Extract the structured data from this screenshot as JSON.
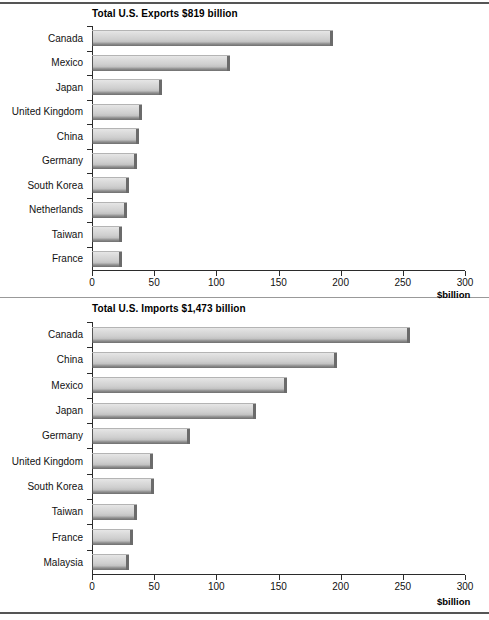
{
  "chart_data": [
    {
      "type": "bar",
      "orientation": "horizontal",
      "title": "Total U.S. Exports $819 billion",
      "xlabel": "$billion",
      "ylabel": "",
      "xlim": [
        0,
        300
      ],
      "xticks": [
        0,
        50,
        100,
        150,
        200,
        250,
        300
      ],
      "xtick_labels": [
        "0",
        "50",
        "100",
        "150",
        "200",
        "250",
        "300"
      ],
      "grid": false,
      "legend": null,
      "categories": [
        "Canada",
        "Mexico",
        "Japan",
        "United Kingdom",
        "China",
        "Germany",
        "South Korea",
        "Netherlands",
        "Taiwan",
        "France"
      ],
      "values": [
        194,
        111,
        56,
        40,
        38,
        36,
        30,
        28,
        24,
        24
      ]
    },
    {
      "type": "bar",
      "orientation": "horizontal",
      "title": "Total U.S. Imports $1,473 billion",
      "xlabel": "$billion",
      "ylabel": "",
      "xlim": [
        0,
        300
      ],
      "xticks": [
        0,
        50,
        100,
        150,
        200,
        250,
        300
      ],
      "xtick_labels": [
        "0",
        "50",
        "100",
        "150",
        "200",
        "250",
        "300"
      ],
      "grid": false,
      "legend": null,
      "categories": [
        "Canada",
        "China",
        "Mexico",
        "Japan",
        "Germany",
        "United Kingdom",
        "South Korea",
        "Taiwan",
        "France",
        "Malaysia"
      ],
      "values": [
        256,
        197,
        157,
        132,
        79,
        49,
        50,
        36,
        33,
        30
      ]
    }
  ],
  "colors": {
    "bar_fill_light": "#dcdcdc",
    "bar_fill_dark": "#6f6f6f",
    "axis": "#2b2b2b",
    "text": "#111111",
    "background": "#ffffff"
  }
}
